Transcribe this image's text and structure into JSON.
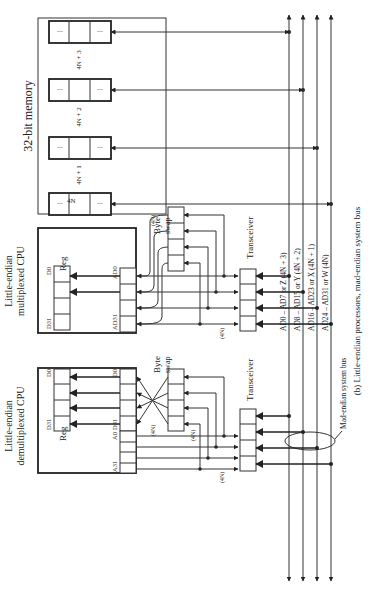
{
  "figure": {
    "caption": "(b) Little-endian processors, mad-endian system bus"
  },
  "memory": {
    "title": "32-bit memory",
    "words": [
      {
        "label": "4N + 3",
        "cell_left": "...",
        "cell_right": "..."
      },
      {
        "label": "4N + 2",
        "cell_left": "...",
        "cell_right": "..."
      },
      {
        "label": "4N + 1",
        "cell_left": "...",
        "cell_right": "..."
      },
      {
        "label": "4N",
        "cell_left": "...",
        "cell_right": "..."
      }
    ]
  },
  "multiplexed_cpu": {
    "title_line1": "Little-endian",
    "title_line2": "multiplexed CPU",
    "reg_label": "Reg",
    "reg_top": "D0",
    "reg_bottom": "D31",
    "port_top": "AD0",
    "port_bottom": "AD31",
    "byte_swap_line1": "Byte",
    "byte_swap_line2": "swap",
    "annotation_swap": "(4N)",
    "annotation_port": "(4N)",
    "transceiver": "Transceiver"
  },
  "demultiplexed_cpu": {
    "title_line1": "Little-endian",
    "title_line2": "demultiplexed CPU",
    "reg_label": "Reg",
    "reg_top": "D0",
    "reg_bottom": "D31",
    "data_top": "D0",
    "data_bottom": "D31",
    "addr_top": "A0",
    "addr_bottom": "A31",
    "byte_swap_line1": "Byte",
    "byte_swap_line2": "swap",
    "annotation_cross": "(4N)",
    "annotation_swap": "(4N)",
    "annotation_addr": "(4N)",
    "transceiver": "Transceiver"
  },
  "bus": {
    "lines": [
      "AD0 – AD7 or Z (4N + 3)",
      "AD8 – AD15 or Y (4N + 2)",
      "AD16 – AD23 or X (4N + 1)",
      "AD24 – AD31 or W (4N)"
    ],
    "label": "Mad-endian system bus"
  }
}
